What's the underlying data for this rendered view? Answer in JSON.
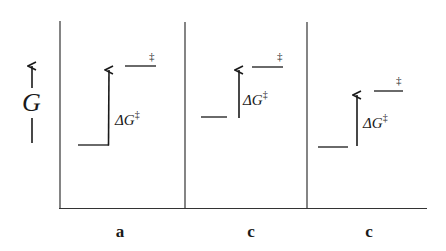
{
  "diagram": {
    "type": "free-energy level comparison",
    "y_axis": {
      "label": "G",
      "arrow": "up"
    },
    "panels": [
      {
        "id": "a",
        "label": "a",
        "barrier_label": "ΔG",
        "barrier_sup": "‡",
        "ts_mark": "‡",
        "ground_y": 145,
        "ts_y": 66
      },
      {
        "id": "b",
        "label": "b",
        "barrier_label": "ΔG",
        "barrier_sup": "‡",
        "ts_mark": "‡",
        "ground_y": 117,
        "ts_y": 67
      },
      {
        "id": "c",
        "label": "c",
        "barrier_label": "ΔG",
        "barrier_sup": "‡",
        "ts_mark": "‡",
        "ground_y": 147,
        "ts_y": 91
      }
    ]
  }
}
